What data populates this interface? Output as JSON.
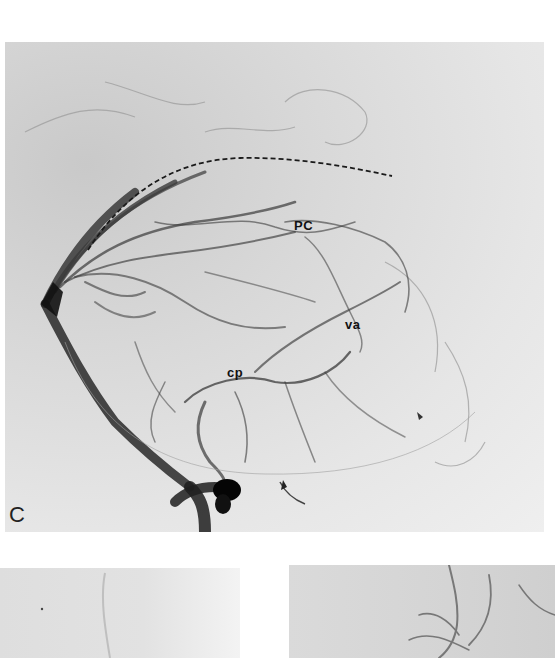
{
  "figure": {
    "main_panel": {
      "panel_letter": "C",
      "labels": {
        "pc": "PC",
        "va": "va",
        "cp": "cp"
      },
      "annotation": "dashed-curve"
    },
    "bottom_left_panel": {},
    "bottom_right_panel": {}
  },
  "colors": {
    "background": "#ffffff",
    "film": "#dedede",
    "vessel": "#2a2a2a",
    "dense_vessel": "#0a0a0a"
  }
}
